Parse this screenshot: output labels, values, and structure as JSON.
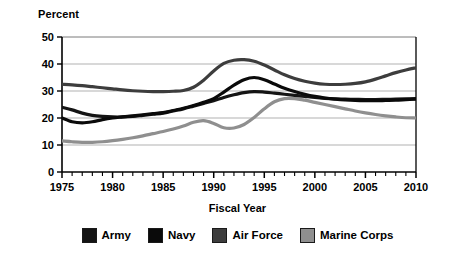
{
  "chart_data": {
    "type": "line",
    "title": "",
    "ylabel": "Percent",
    "xlabel": "Fiscal Year",
    "xlim": [
      1975,
      2010
    ],
    "ylim": [
      0,
      50
    ],
    "yticks": [
      0,
      10,
      20,
      30,
      40,
      50
    ],
    "xticks": [
      1975,
      1980,
      1985,
      1990,
      1995,
      2000,
      2005,
      2010
    ],
    "xtick_labels": [
      "1975",
      "1980",
      "1985",
      "1990",
      "1995",
      "2000",
      "2005",
      "2010"
    ],
    "ytick_labels": [
      "0",
      "10",
      "20",
      "30",
      "40",
      "50"
    ],
    "minor_xtick_interval": 1,
    "grid": "horizontal",
    "legend_position": "bottom",
    "x": [
      1975,
      1976,
      1977,
      1978,
      1979,
      1980,
      1981,
      1982,
      1983,
      1984,
      1985,
      1986,
      1987,
      1988,
      1989,
      1990,
      1991,
      1992,
      1993,
      1994,
      1995,
      1996,
      1997,
      1998,
      1999,
      2000,
      2001,
      2002,
      2003,
      2004,
      2005,
      2006,
      2007,
      2008,
      2009,
      2010
    ],
    "series": [
      {
        "name": "Army",
        "color": "#141414",
        "values": [
          24.0,
          23.0,
          21.8,
          21.0,
          20.6,
          20.4,
          20.4,
          20.6,
          21.0,
          21.4,
          21.8,
          22.6,
          23.4,
          24.4,
          25.4,
          26.4,
          27.6,
          28.6,
          29.4,
          29.8,
          29.6,
          29.2,
          28.8,
          28.4,
          28.0,
          27.6,
          27.3,
          27.1,
          27.0,
          26.9,
          26.8,
          26.8,
          26.9,
          27.0,
          27.1,
          27.2
        ]
      },
      {
        "name": "Navy",
        "color": "#0a0a0a",
        "values": [
          20.0,
          18.6,
          18.2,
          18.6,
          19.4,
          20.0,
          20.4,
          20.8,
          21.2,
          21.6,
          22.0,
          22.8,
          23.6,
          24.6,
          25.8,
          27.2,
          29.6,
          32.2,
          34.2,
          35.0,
          34.2,
          32.6,
          31.0,
          29.8,
          28.8,
          28.0,
          27.4,
          27.0,
          26.7,
          26.5,
          26.4,
          26.4,
          26.5,
          26.6,
          26.8,
          27.0
        ]
      },
      {
        "name": "Air Force",
        "color": "#3d3d3d",
        "values": [
          32.5,
          32.3,
          32.0,
          31.6,
          31.2,
          30.8,
          30.4,
          30.1,
          29.9,
          29.8,
          29.8,
          29.9,
          30.2,
          31.4,
          34.0,
          37.4,
          40.2,
          41.4,
          41.6,
          41.0,
          39.6,
          37.8,
          36.0,
          34.6,
          33.6,
          32.9,
          32.5,
          32.4,
          32.5,
          32.8,
          33.4,
          34.4,
          35.6,
          36.8,
          37.8,
          38.6
        ]
      },
      {
        "name": "Marine Corps",
        "color": "#8f8f8f",
        "values": [
          11.5,
          11.2,
          11.0,
          11.0,
          11.2,
          11.6,
          12.1,
          12.7,
          13.4,
          14.2,
          15.0,
          15.9,
          17.0,
          18.4,
          19.0,
          18.0,
          16.4,
          16.3,
          17.6,
          20.2,
          23.4,
          26.0,
          27.2,
          27.2,
          26.6,
          25.8,
          25.0,
          24.2,
          23.4,
          22.6,
          21.9,
          21.3,
          20.8,
          20.4,
          20.1,
          20.0
        ]
      }
    ]
  },
  "legend": {
    "items": [
      {
        "label": "Army",
        "color": "#141414"
      },
      {
        "label": "Navy",
        "color": "#0a0a0a"
      },
      {
        "label": "Air Force",
        "color": "#3d3d3d"
      },
      {
        "label": "Marine Corps",
        "color": "#8f8f8f"
      }
    ]
  },
  "axes": {
    "ylabel": "Percent",
    "xlabel": "Fiscal Year"
  }
}
